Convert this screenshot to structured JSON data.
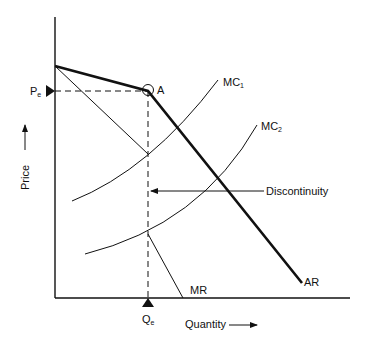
{
  "diagram": {
    "type": "kinked-demand-curve",
    "colors": {
      "ink": "#111111",
      "background": "#ffffff"
    },
    "axes": {
      "y_label": "Price",
      "x_label": "Quantity",
      "y_axis": {
        "x": 55,
        "y_top": 17,
        "y_bottom": 298
      },
      "x_axis": {
        "y": 298,
        "x_left": 55,
        "x_right": 350
      }
    },
    "labels": {
      "pe_main": "P",
      "pe_sub": "e",
      "qe_main": "Q",
      "qe_sub": "e",
      "point_a": "A",
      "mc1_main": "MC",
      "mc1_sub": "1",
      "mc2_main": "MC",
      "mc2_sub": "2",
      "discontinuity": "Discontinuity",
      "mr": "MR",
      "ar": "AR"
    },
    "curves": {
      "AR": {
        "points": [
          [
            55,
            66
          ],
          [
            148,
            91
          ],
          [
            302,
            283
          ]
        ],
        "style": "thick"
      },
      "MR": {
        "segments": [
          [
            [
              55,
              66
            ],
            [
              148,
              154
            ]
          ],
          [
            [
              148,
              234
            ],
            [
              183,
              298
            ]
          ]
        ],
        "style": "thin"
      },
      "MC1": {
        "start": [
          72,
          201
        ],
        "control": [
          150,
          170
        ],
        "end": [
          218,
          80
        ]
      },
      "MC2": {
        "start": [
          85,
          254
        ],
        "control": [
          200,
          225
        ],
        "end": [
          257,
          125
        ]
      }
    },
    "equilibrium": {
      "point_a": [
        148,
        91
      ],
      "price_level_y": 91,
      "quantity_level_x": 148
    },
    "discontinuity_arrow": {
      "y": 191,
      "x_from": 264,
      "x_to": 150
    }
  }
}
